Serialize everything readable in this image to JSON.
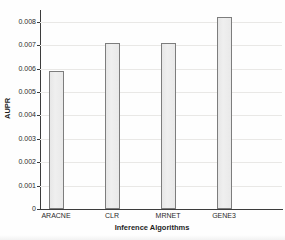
{
  "chart_data": {
    "type": "bar",
    "title": "",
    "categories": [
      "ARACNE",
      "CLR",
      "MRNET",
      "GENE3"
    ],
    "values": [
      0.0059,
      0.0071,
      0.0071,
      0.0082
    ],
    "xlabel": "Inference Algorithms",
    "ylabel": "AUPR",
    "ylim": [
      0,
      0.0085
    ],
    "yticks": [
      0,
      0.001,
      0.002,
      0.003,
      0.004,
      0.005,
      0.006,
      0.007,
      0.008
    ],
    "ytick_labels": [
      "0",
      "0.001",
      "0.002",
      "0.003",
      "0.004",
      "0.005",
      "0.006",
      "0.007",
      "0.008"
    ],
    "grid": true,
    "legend": "none",
    "bar_fill": "#ececec",
    "bar_border": "#7d7d7d",
    "gridline_color": "#e9e8e6",
    "axis_color": "#3c3c3c"
  }
}
